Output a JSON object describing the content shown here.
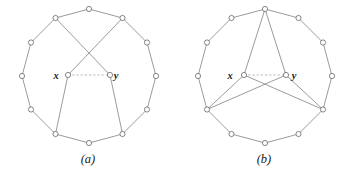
{
  "figure": {
    "background_color": "#ffffff",
    "edge_color": "#7a7a7a",
    "dashed_edge_color": "#9a9a9a",
    "vertex_fill_color": "#ffffff",
    "vertex_stroke_color": "#5f5f5f",
    "label_color": "#1a1a1a"
  },
  "panels": [
    {
      "id": "a",
      "caption": "(a)",
      "caption_x": 88,
      "caption_y": 163,
      "center": {
        "x": 89,
        "y": 76
      },
      "radius": 67,
      "outer_vertex_count": 12,
      "labels": {
        "x": {
          "text": "x",
          "x": 56,
          "y": 79
        },
        "y": {
          "text": "y",
          "x": 116,
          "y": 79
        }
      },
      "inner_vertices": [
        {
          "name": "x",
          "x": 68,
          "y": 75
        },
        {
          "name": "y",
          "x": 110,
          "y": 75
        }
      ],
      "outer_vertices": [
        {
          "i": 0,
          "x": 89.0,
          "y": 9.0
        },
        {
          "i": 1,
          "x": 122.5,
          "y": 18.0
        },
        {
          "i": 2,
          "x": 147.0,
          "y": 42.5
        },
        {
          "i": 3,
          "x": 156.0,
          "y": 76.0
        },
        {
          "i": 4,
          "x": 147.0,
          "y": 109.5
        },
        {
          "i": 5,
          "x": 122.5,
          "y": 134.0
        },
        {
          "i": 6,
          "x": 89.0,
          "y": 143.0
        },
        {
          "i": 7,
          "x": 55.5,
          "y": 134.0
        },
        {
          "i": 8,
          "x": 31.0,
          "y": 109.5
        },
        {
          "i": 9,
          "x": 22.0,
          "y": 76.0
        },
        {
          "i": 10,
          "x": 31.0,
          "y": 42.5
        },
        {
          "i": 11,
          "x": 55.5,
          "y": 18.0
        }
      ],
      "ring_edges": [
        [
          0,
          1
        ],
        [
          1,
          2
        ],
        [
          2,
          3
        ],
        [
          3,
          4
        ],
        [
          4,
          5
        ],
        [
          5,
          6
        ],
        [
          6,
          7
        ],
        [
          7,
          8
        ],
        [
          8,
          9
        ],
        [
          9,
          10
        ],
        [
          10,
          11
        ],
        [
          11,
          0
        ]
      ],
      "spoke_edges": [
        {
          "from": "x",
          "to_outer": 1,
          "style": "solid",
          "note": "x to upper-right vertex (crossing)"
        },
        {
          "from": "y",
          "to_outer": 11,
          "style": "solid",
          "note": "y to upper-left vertex (crossing)"
        },
        {
          "from": "x",
          "to_outer": 7,
          "style": "solid",
          "note": "x to lower-left vertex"
        },
        {
          "from": "y",
          "to_outer": 5,
          "style": "solid",
          "note": "y to lower-right vertex"
        }
      ],
      "inner_edge": {
        "from": "x",
        "to": "y",
        "style": "dashed"
      }
    },
    {
      "id": "b",
      "caption": "(b)",
      "caption_x": 88,
      "caption_y": 163,
      "center": {
        "x": 89,
        "y": 76
      },
      "radius": 67,
      "outer_vertex_count": 12,
      "labels": {
        "x": {
          "text": "x",
          "x": 54,
          "y": 79
        },
        "y": {
          "text": "y",
          "x": 118,
          "y": 79
        }
      },
      "inner_vertices": [
        {
          "name": "x",
          "x": 68,
          "y": 75
        },
        {
          "name": "y",
          "x": 110,
          "y": 75
        }
      ],
      "outer_vertices": [
        {
          "i": 0,
          "x": 89.0,
          "y": 9.0
        },
        {
          "i": 1,
          "x": 122.5,
          "y": 18.0
        },
        {
          "i": 2,
          "x": 147.0,
          "y": 42.5
        },
        {
          "i": 3,
          "x": 156.0,
          "y": 76.0
        },
        {
          "i": 4,
          "x": 147.0,
          "y": 109.5
        },
        {
          "i": 5,
          "x": 122.5,
          "y": 134.0
        },
        {
          "i": 6,
          "x": 89.0,
          "y": 143.0
        },
        {
          "i": 7,
          "x": 55.5,
          "y": 134.0
        },
        {
          "i": 8,
          "x": 31.0,
          "y": 109.5
        },
        {
          "i": 9,
          "x": 22.0,
          "y": 76.0
        },
        {
          "i": 10,
          "x": 31.0,
          "y": 42.5
        },
        {
          "i": 11,
          "x": 55.5,
          "y": 18.0
        }
      ],
      "ring_edges": [
        [
          0,
          1
        ],
        [
          1,
          2
        ],
        [
          2,
          3
        ],
        [
          3,
          4
        ],
        [
          4,
          5
        ],
        [
          5,
          6
        ],
        [
          6,
          7
        ],
        [
          7,
          8
        ],
        [
          8,
          9
        ],
        [
          9,
          10
        ],
        [
          10,
          11
        ],
        [
          11,
          0
        ]
      ],
      "spoke_edges": [
        {
          "from": "x",
          "to_outer": 0,
          "style": "solid",
          "note": "x to top vertex"
        },
        {
          "from": "y",
          "to_outer": 0,
          "style": "solid",
          "note": "y to top vertex"
        },
        {
          "from": "x",
          "to_outer": 8,
          "style": "solid",
          "note": "x to lower-left vertex"
        },
        {
          "from": "y",
          "to_outer": 4,
          "style": "solid",
          "note": "y to lower-right vertex"
        },
        {
          "from": "x",
          "to_outer": 4,
          "style": "solid",
          "note": "x to lower-right vertex (crossing)"
        },
        {
          "from": "y",
          "to_outer": 8,
          "style": "solid",
          "note": "y to lower-left vertex (crossing)"
        }
      ],
      "inner_edge": {
        "from": "x",
        "to": "y",
        "style": "dashed"
      }
    }
  ]
}
